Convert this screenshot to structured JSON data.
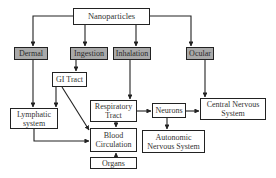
{
  "diagram": {
    "colors": {
      "route_fill": "#a9a9a9",
      "node_fill": "#ffffff",
      "stroke": "#222222"
    },
    "nodes": {
      "nanoparticles": {
        "label": "Nanoparticles",
        "type": "root"
      },
      "dermal": {
        "label": "Dermal",
        "type": "route"
      },
      "ingestion": {
        "label": "Ingestion",
        "type": "route"
      },
      "inhalation": {
        "label": "Inhalation",
        "type": "route"
      },
      "ocular": {
        "label": "Ocular",
        "type": "route"
      },
      "gi_tract": {
        "label": "GI Tract",
        "type": "organ"
      },
      "lymphatic": {
        "label": "Lymphatic\nsystem",
        "type": "organ"
      },
      "respiratory": {
        "label": "Respiratory\nTract",
        "type": "organ"
      },
      "neurons": {
        "label": "Neurons",
        "type": "organ"
      },
      "cns": {
        "label": "Central Nervous\nSystem",
        "type": "organ"
      },
      "blood": {
        "label": "Blood\nCirculation",
        "type": "organ"
      },
      "ans": {
        "label": "Autonomic\nNervous System",
        "type": "organ"
      },
      "organs": {
        "label": "Organs",
        "type": "organ"
      }
    },
    "edges": [
      [
        "Nanoparticles",
        "Dermal"
      ],
      [
        "Nanoparticles",
        "Ingestion"
      ],
      [
        "Nanoparticles",
        "Inhalation"
      ],
      [
        "Nanoparticles",
        "Ocular"
      ],
      [
        "Ingestion",
        "GI Tract"
      ],
      [
        "Dermal",
        "Lymphatic system"
      ],
      [
        "GI Tract",
        "Lymphatic system"
      ],
      [
        "GI Tract",
        "Blood Circulation"
      ],
      [
        "Inhalation",
        "Respiratory Tract"
      ],
      [
        "Respiratory Tract",
        "Neurons"
      ],
      [
        "Respiratory Tract",
        "Blood Circulation"
      ],
      [
        "Neurons",
        "Central Nervous System"
      ],
      [
        "Neurons",
        "Autonomic Nervous System"
      ],
      [
        "Ocular",
        "Central Nervous System"
      ],
      [
        "Lymphatic system",
        "Blood Circulation"
      ],
      [
        "Organs",
        "Blood Circulation"
      ]
    ]
  }
}
